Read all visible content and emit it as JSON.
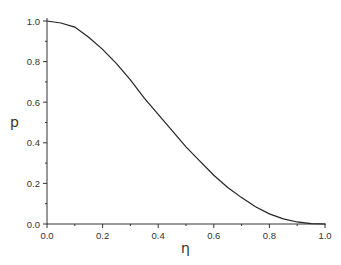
{
  "chart_data": {
    "type": "line",
    "title": "",
    "xlabel": "η",
    "ylabel": "p",
    "xlim": [
      0.0,
      1.0
    ],
    "ylim": [
      0.0,
      1.0
    ],
    "grid": false,
    "legend": null,
    "x_ticks": [
      "0.0",
      "0.2",
      "0.4",
      "0.6",
      "0.8",
      "1.0"
    ],
    "y_ticks": [
      "0.0",
      "0.2",
      "0.4",
      "0.6",
      "0.8",
      "1.0"
    ],
    "series": [
      {
        "name": "p(η)",
        "color": "#222222",
        "x": [
          0.0,
          0.05,
          0.1,
          0.15,
          0.2,
          0.25,
          0.3,
          0.35,
          0.4,
          0.45,
          0.5,
          0.55,
          0.6,
          0.65,
          0.7,
          0.75,
          0.8,
          0.85,
          0.9,
          0.95,
          1.0
        ],
        "y": [
          1.0,
          0.99,
          0.97,
          0.92,
          0.86,
          0.79,
          0.71,
          0.62,
          0.54,
          0.46,
          0.38,
          0.31,
          0.24,
          0.18,
          0.13,
          0.085,
          0.05,
          0.025,
          0.01,
          0.002,
          0.0
        ]
      }
    ]
  }
}
